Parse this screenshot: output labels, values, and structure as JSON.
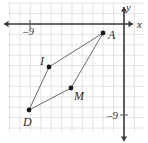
{
  "figure": {
    "type": "coordinate-grid-quadrilateral",
    "width": 148,
    "height": 143,
    "background_color": "#ffffff"
  },
  "grid": {
    "line_color": "#d9d9d9",
    "cell_size_px": 10.4,
    "x_min_px": 8,
    "x_max_px": 144,
    "y_min_px": 3,
    "y_max_px": 132,
    "visible": true
  },
  "axes": {
    "x_axis": {
      "label": "x",
      "label_x": 137,
      "label_y": 19,
      "color": "#3a3a3a",
      "pixel_y": 24,
      "from_x": 4,
      "to_x": 133,
      "arrow_left": true,
      "arrow_right": true
    },
    "y_axis": {
      "label": "y",
      "label_x": 126,
      "label_y": 2,
      "color": "#3a3a3a",
      "pixel_x": 124,
      "from_y": 7,
      "to_y": 141,
      "arrow_up": true,
      "arrow_down": true
    },
    "origin_px": {
      "x": 124,
      "y": 24
    }
  },
  "ticks": [
    {
      "name": "x-tick-negative-9",
      "label": "–9",
      "axis": "x",
      "value": -9,
      "pixel_x": 30,
      "pixel_y": 24,
      "label_x": 23,
      "label_y": 26
    },
    {
      "name": "y-tick-negative-9",
      "label": "–9",
      "axis": "y",
      "value": -9,
      "pixel_x": 124,
      "pixel_y": 115,
      "label_x": 107,
      "label_y": 110
    }
  ],
  "shape": {
    "name": "quadrilateral-DIAM",
    "stroke_color": "#6b6b6b",
    "stroke_width": 1,
    "fill": "none",
    "path_order": [
      "D",
      "I",
      "A",
      "M"
    ],
    "vertices": [
      {
        "label": "D",
        "pixel_x": 29,
        "pixel_y": 110,
        "grid_x": -9,
        "grid_y": -8.3,
        "label_x": 23,
        "label_y": 116,
        "dot_radius": 2.4
      },
      {
        "label": "I",
        "pixel_x": 49,
        "pixel_y": 67,
        "grid_x": -7.2,
        "grid_y": -4.1,
        "label_x": 40,
        "label_y": 55,
        "dot_radius": 2.4
      },
      {
        "label": "A",
        "pixel_x": 103,
        "pixel_y": 33,
        "grid_x": -2,
        "grid_y": -0.9,
        "label_x": 108,
        "label_y": 29,
        "dot_radius": 2.4
      },
      {
        "label": "M",
        "pixel_x": 71,
        "pixel_y": 88,
        "grid_x": -5.1,
        "grid_y": -6.2,
        "label_x": 74,
        "label_y": 90,
        "dot_radius": 2.4
      }
    ],
    "dot_color": "#1a1a1a"
  }
}
